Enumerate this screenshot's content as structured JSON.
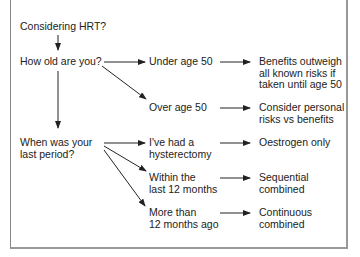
{
  "diagram": {
    "start": "Considering HRT?",
    "q_age": "How old are you?",
    "q_period": "When was your\nlast period?",
    "age_options": [
      {
        "label": "Under age 50",
        "outcome": "Benefits outweigh\nall known risks if\ntaken until age 50"
      },
      {
        "label": "Over age 50",
        "outcome": "Consider personal\nrisks vs benefits"
      }
    ],
    "period_options": [
      {
        "label": "I've had a\nhysterectomy",
        "outcome": "Oestrogen only"
      },
      {
        "label": "Within the\nlast 12 months",
        "outcome": "Sequential\ncombined"
      },
      {
        "label": "More than\n12 months ago",
        "outcome": "Continuous\ncombined"
      }
    ]
  },
  "colors": {
    "line": "#222222",
    "border": "#999999"
  }
}
